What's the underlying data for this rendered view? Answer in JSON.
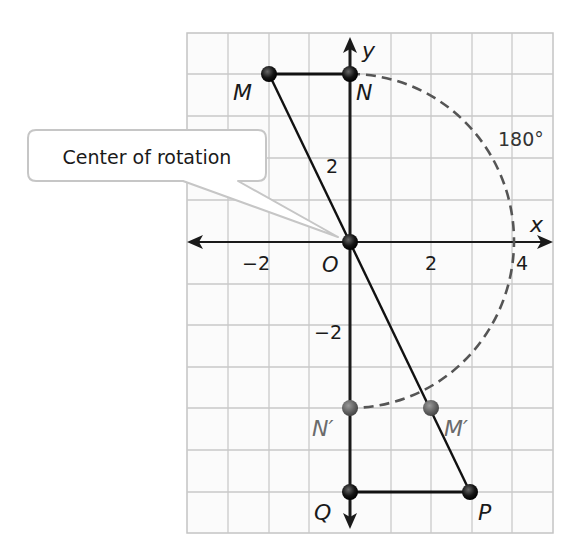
{
  "figure": {
    "type": "coordinate-plane rotation diagram",
    "axes": {
      "x_label": "x",
      "y_label": "y",
      "x_ticks": [
        {
          "value": -2,
          "label": "−2"
        },
        {
          "value": 2,
          "label": "2"
        },
        {
          "value": 4,
          "label": "4"
        }
      ],
      "y_ticks": [
        {
          "value": 2,
          "label": "2"
        },
        {
          "value": -2,
          "label": "−2"
        }
      ],
      "origin_label": "O",
      "grid": {
        "x_min": -4,
        "x_max": 5,
        "y_min": -7,
        "y_max": 5,
        "step": 1
      }
    },
    "points": {
      "M": {
        "label": "M",
        "x": -2,
        "y": 4
      },
      "N": {
        "label": "N",
        "x": 0,
        "y": 4
      },
      "O": {
        "label": "O",
        "x": 0,
        "y": 0
      },
      "N_prime": {
        "label": "N′",
        "x": 0,
        "y": -4
      },
      "M_prime": {
        "label": "M′",
        "x": 2,
        "y": -4
      },
      "Q": {
        "label": "Q",
        "x": 0,
        "y": -6
      },
      "P": {
        "label": "P",
        "x": 3,
        "y": -6
      }
    },
    "angle_label": "180°",
    "callout": {
      "text": "Center of rotation"
    },
    "colors": {
      "grid": "#c8c8c8",
      "axis": "#1a1a1a",
      "segment": "#111111",
      "arc": "#555555",
      "point": "#111111",
      "image_point": "#6b6b6b",
      "image_label": "#6b6b6b",
      "callout_border": "#c8c8c8"
    }
  }
}
